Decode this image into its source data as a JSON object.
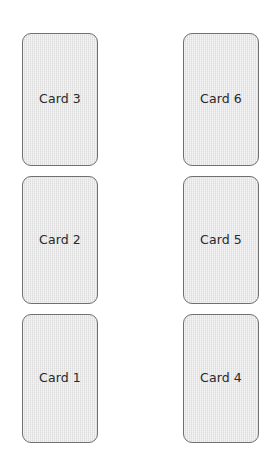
{
  "canvas": {
    "width": 279,
    "height": 473,
    "background_color": "#ffffff"
  },
  "style": {
    "card_fill_color": "#dcdcdc",
    "card_border_color": "#6f7071",
    "card_label_color": "#28292b",
    "card_corner_radius": 9,
    "card_width": 76,
    "card_height": 130,
    "card_gap": 10,
    "column_gap": 85
  },
  "board": {
    "columns": [
      {
        "name": "left-column",
        "cards": [
          {
            "label": "Card 3",
            "stack_position": 3
          },
          {
            "label": "Card 2",
            "stack_position": 2
          },
          {
            "label": "Card 1",
            "stack_position": 1
          }
        ]
      },
      {
        "name": "right-column",
        "cards": [
          {
            "label": "Card 6",
            "stack_position": 3
          },
          {
            "label": "Card 5",
            "stack_position": 2
          },
          {
            "label": "Card 4",
            "stack_position": 1
          }
        ]
      }
    ]
  }
}
